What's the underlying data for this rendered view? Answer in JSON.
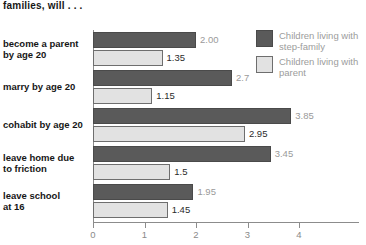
{
  "chart_data": {
    "type": "bar",
    "orientation": "horizontal",
    "title": "families, will . . .",
    "xlabel": "",
    "ylabel": "",
    "xlim": [
      0,
      4
    ],
    "xticks": [
      "0",
      "1",
      "2",
      "3",
      "4"
    ],
    "grid": false,
    "legend_position": "right",
    "categories": [
      "become a parent by age 20",
      "marry by age 20",
      "cohabit by age 20",
      "leave home due to friction",
      "leave school at 16"
    ],
    "category_lines": [
      [
        "become a parent",
        "by age 20"
      ],
      [
        "marry by age 20"
      ],
      [
        "cohabit by age 20"
      ],
      [
        "leave home due",
        "to friction"
      ],
      [
        "leave school",
        "at 16"
      ]
    ],
    "series": [
      {
        "name": "Children living with step-family",
        "color": "#5a5a5a",
        "values": [
          2.0,
          2.7,
          3.85,
          3.45,
          1.95
        ],
        "labels": [
          "2.00",
          "2.7",
          "3.85",
          "3.45",
          "1.95"
        ]
      },
      {
        "name": "Children living with parent",
        "color": "#e2e2e2",
        "values": [
          1.35,
          1.15,
          2.95,
          1.5,
          1.45
        ],
        "labels": [
          "1.35",
          "1.15",
          "2.95",
          "1.5",
          "1.45"
        ]
      }
    ]
  },
  "legend": {
    "items": [
      {
        "label": "Children living with step-family",
        "color": "#5a5a5a"
      },
      {
        "label": "Children living with parent",
        "color": "#e2e2e2"
      }
    ]
  }
}
